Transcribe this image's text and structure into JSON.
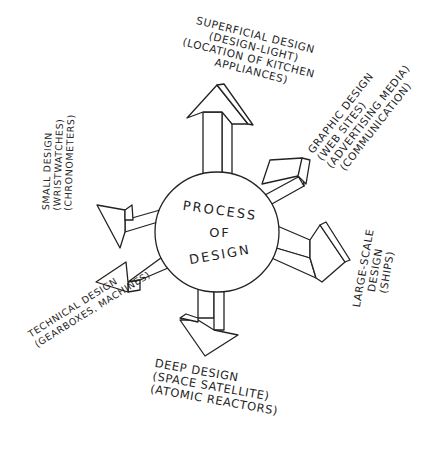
{
  "diagram": {
    "type": "radial-arrows",
    "style": "hand-drawn sketch",
    "center": {
      "lines": [
        "PROCESS",
        "OF",
        "DESIGN"
      ]
    },
    "branches": [
      {
        "direction": "up",
        "lines": [
          "SUPERFICIAL DESIGN",
          "(DESIGN-LIGHT)",
          "(LOCATION OF KITCHEN",
          "APPLIANCES)"
        ]
      },
      {
        "direction": "upper-right",
        "lines": [
          "GRAPHIC DESIGN",
          "(WEB SITES)",
          "(ADVERTISING MEDIA)",
          "(COMMUNICATION)"
        ]
      },
      {
        "direction": "right",
        "lines": [
          "LARGE-SCALE",
          "DESIGN",
          "(SHIPS)"
        ]
      },
      {
        "direction": "down",
        "lines": [
          "DEEP DESIGN",
          "(SPACE SATELLITE)",
          "(ATOMIC REACTORS)"
        ]
      },
      {
        "direction": "lower-left",
        "lines": [
          "TECHNICAL DESIGN",
          "(GEARBOXES, MACHINES)"
        ]
      },
      {
        "direction": "left",
        "lines": [
          "SMALL DESIGN",
          "(WRISTWATCHES)",
          "(CHRONOMETERS)"
        ]
      }
    ]
  }
}
